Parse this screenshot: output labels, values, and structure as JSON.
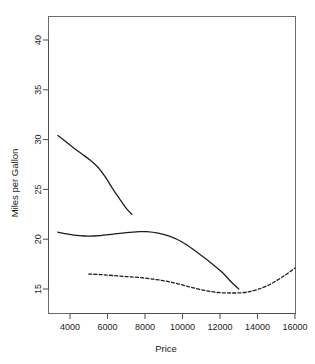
{
  "chart_data": {
    "type": "line",
    "title": "",
    "xlabel": "Price",
    "ylabel": "Miles per Gallon",
    "xlim": [
      3000,
      16400
    ],
    "ylim": [
      13.2,
      41.5
    ],
    "grid": false,
    "legend": "none",
    "xticks": [
      4000,
      6000,
      8000,
      10000,
      12000,
      14000,
      16000
    ],
    "xtick_labels": [
      "4000",
      "6000",
      "8000",
      "10000",
      "12000",
      "14000",
      "16000"
    ],
    "yticks": [
      15,
      20,
      25,
      30,
      35,
      40
    ],
    "ytick_labels": [
      "15",
      "20",
      "25",
      "30",
      "35",
      "40"
    ],
    "series": [
      {
        "name": "upper-curve",
        "style": "solid",
        "color": "#1c1c1c",
        "x": [
          3350,
          3700,
          4100,
          4600,
          5100,
          5500,
          5900,
          6300,
          6700,
          7000,
          7300
        ],
        "y": [
          30.4,
          29.9,
          29.3,
          28.6,
          27.9,
          27.2,
          26.2,
          25.0,
          23.9,
          23.1,
          22.5
        ]
      },
      {
        "name": "middle-curve",
        "style": "solid",
        "color": "#1c1c1c",
        "x": [
          3350,
          3900,
          4500,
          5000,
          5600,
          6300,
          7000,
          7700,
          8100,
          8700,
          9300,
          10000,
          10700,
          11400,
          12100,
          12600,
          13000
        ],
        "y": [
          20.7,
          20.5,
          20.35,
          20.3,
          20.35,
          20.5,
          20.65,
          20.75,
          20.75,
          20.6,
          20.3,
          19.7,
          18.8,
          17.8,
          16.7,
          15.7,
          15.0
        ]
      },
      {
        "name": "lower-curve-dashed",
        "style": "dashed",
        "color": "#1c1c1c",
        "x": [
          5000,
          5600,
          6300,
          7000,
          7700,
          8400,
          9100,
          9800,
          10500,
          11200,
          11900,
          12600,
          13300,
          14000,
          14700,
          15400,
          16000
        ],
        "y": [
          16.5,
          16.45,
          16.35,
          16.25,
          16.15,
          16.0,
          15.8,
          15.5,
          15.15,
          14.85,
          14.65,
          14.6,
          14.65,
          14.95,
          15.5,
          16.3,
          17.1
        ]
      }
    ]
  },
  "axes": {
    "x_title": "Price",
    "y_title": "Miles per Gallon"
  }
}
